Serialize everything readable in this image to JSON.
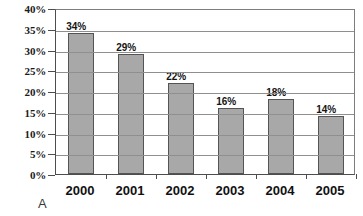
{
  "panel": {
    "letter": "A"
  },
  "chart_data": {
    "type": "bar",
    "title": "",
    "subtitle": "",
    "xlabel": "",
    "ylabel": "",
    "categories": [
      "2000",
      "2001",
      "2002",
      "2003",
      "2004",
      "2005"
    ],
    "values": [
      34,
      29,
      22,
      16,
      18,
      14
    ],
    "value_labels": [
      "34%",
      "29%",
      "22%",
      "16%",
      "18%",
      "14%"
    ],
    "series": [
      {
        "name": "",
        "values": [
          34,
          29,
          22,
          16,
          18,
          14
        ]
      }
    ],
    "ylim": [
      0,
      40
    ],
    "ytick_values": [
      0,
      5,
      10,
      15,
      20,
      25,
      30,
      35,
      40
    ],
    "ytick_labels": [
      "0%",
      "5%",
      "10%",
      "15%",
      "20%",
      "25%",
      "30%",
      "35%",
      "40%"
    ],
    "grid": true,
    "grid_axis": "y",
    "legend": false,
    "legend_position": "none",
    "annotations": [
      "A"
    ],
    "bar_color": "#a8a8a8",
    "bar_border_color": "#545454",
    "gridline_color": "#8f8f8f",
    "axis_color": "#4d4d4d",
    "background_color": "#ffffff",
    "data_label_color": "#141414"
  }
}
